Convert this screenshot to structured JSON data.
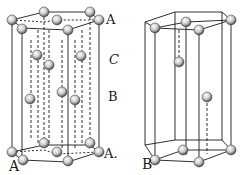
{
  "figures": [
    {
      "id": "A",
      "caption": "A",
      "description": "Hexagonal close-packed unit cell with ABA layer stacking",
      "layer_labels": {
        "top": "A",
        "upper_mid": "C",
        "lower_mid": "B",
        "bottom": "A."
      }
    },
    {
      "id": "B",
      "caption": "B",
      "description": "Hexagonal primitive cell with single interior atom"
    }
  ],
  "colors": {
    "line": "#1a1a1a",
    "sphere_fill": "#d8d8d8",
    "sphere_shade": "#555555",
    "background": "#ffffff"
  }
}
